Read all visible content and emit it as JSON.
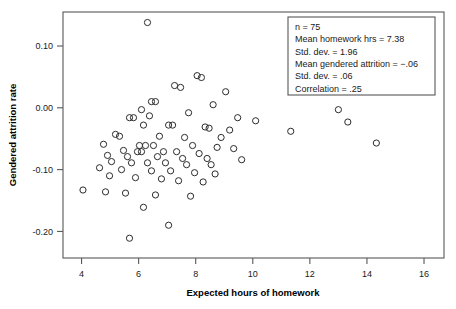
{
  "chart_data": {
    "type": "scatter",
    "title": "",
    "xlabel": "Expected hours of homework",
    "ylabel": "Gendered attrition rate",
    "xlim": [
      3.35,
      16.7
    ],
    "ylim": [
      -0.243,
      0.155
    ],
    "xticks": [
      4,
      6,
      8,
      10,
      12,
      14,
      16
    ],
    "xticklabels": [
      "4",
      "6",
      "8",
      "10",
      "12",
      "14",
      "16"
    ],
    "yticks": [
      0.1,
      0.0,
      -0.1,
      -0.2
    ],
    "yticklabels": [
      "0.10",
      "0.00",
      "-0.10",
      "-0.20"
    ],
    "grid": false,
    "legend": "none",
    "marker": "open-circle",
    "marker_color": "#2b2b2b",
    "points": [
      [
        6.31,
        0.138
      ],
      [
        8.05,
        0.052
      ],
      [
        8.2,
        0.049
      ],
      [
        7.26,
        0.036
      ],
      [
        7.47,
        0.033
      ],
      [
        9.05,
        0.026
      ],
      [
        6.45,
        0.01
      ],
      [
        6.59,
        0.01
      ],
      [
        8.61,
        0.005
      ],
      [
        6.1,
        -0.003
      ],
      [
        13.0,
        -0.003
      ],
      [
        7.75,
        -0.008
      ],
      [
        6.38,
        -0.013
      ],
      [
        5.68,
        -0.016
      ],
      [
        5.82,
        -0.016
      ],
      [
        9.47,
        -0.016
      ],
      [
        10.1,
        -0.021
      ],
      [
        13.33,
        -0.023
      ],
      [
        6.17,
        -0.028
      ],
      [
        7.05,
        -0.028
      ],
      [
        7.19,
        -0.028
      ],
      [
        8.33,
        -0.031
      ],
      [
        8.47,
        -0.033
      ],
      [
        9.19,
        -0.036
      ],
      [
        11.33,
        -0.038
      ],
      [
        5.19,
        -0.043
      ],
      [
        5.33,
        -0.046
      ],
      [
        6.73,
        -0.046
      ],
      [
        7.61,
        -0.048
      ],
      [
        8.89,
        -0.048
      ],
      [
        14.33,
        -0.057
      ],
      [
        4.77,
        -0.059
      ],
      [
        6.03,
        -0.061
      ],
      [
        6.24,
        -0.061
      ],
      [
        6.52,
        -0.061
      ],
      [
        7.89,
        -0.061
      ],
      [
        8.75,
        -0.064
      ],
      [
        9.33,
        -0.066
      ],
      [
        5.47,
        -0.069
      ],
      [
        5.96,
        -0.071
      ],
      [
        6.1,
        -0.071
      ],
      [
        6.87,
        -0.071
      ],
      [
        7.33,
        -0.071
      ],
      [
        8.12,
        -0.074
      ],
      [
        4.91,
        -0.077
      ],
      [
        5.61,
        -0.079
      ],
      [
        6.66,
        -0.079
      ],
      [
        7.54,
        -0.082
      ],
      [
        8.4,
        -0.082
      ],
      [
        9.61,
        -0.084
      ],
      [
        5.05,
        -0.087
      ],
      [
        5.75,
        -0.089
      ],
      [
        6.31,
        -0.089
      ],
      [
        6.94,
        -0.089
      ],
      [
        7.68,
        -0.092
      ],
      [
        8.54,
        -0.092
      ],
      [
        4.63,
        -0.097
      ],
      [
        5.4,
        -0.1
      ],
      [
        6.45,
        -0.102
      ],
      [
        7.12,
        -0.102
      ],
      [
        7.96,
        -0.105
      ],
      [
        8.68,
        -0.107
      ],
      [
        4.98,
        -0.11
      ],
      [
        5.89,
        -0.113
      ],
      [
        6.8,
        -0.115
      ],
      [
        7.4,
        -0.118
      ],
      [
        8.26,
        -0.12
      ],
      [
        4.05,
        -0.133
      ],
      [
        4.84,
        -0.136
      ],
      [
        5.54,
        -0.138
      ],
      [
        6.59,
        -0.141
      ],
      [
        7.82,
        -0.143
      ],
      [
        6.17,
        -0.161
      ],
      [
        7.05,
        -0.19
      ],
      [
        5.68,
        -0.211
      ]
    ],
    "stats_box": {
      "lines": [
        "n = 75",
        "Mean homework hrs = 7.38",
        "Std. dev. = 1.96",
        "Mean gendered attrition = −.06",
        "Std. dev. = .06",
        "Correlation = .25"
      ]
    }
  }
}
